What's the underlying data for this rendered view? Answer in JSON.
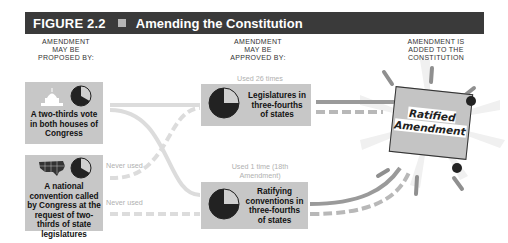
{
  "header": {
    "figure_number": "FIGURE 2.2",
    "title": "Amending the Constitution",
    "bar_color": "#3a3a3a"
  },
  "columns": {
    "proposed": "AMENDMENT MAY BE PROPOSED BY:",
    "approved": "AMENDMENT MAY BE APPROVED BY:",
    "added": "AMENDMENT IS ADDED TO THE CONSTITUTION"
  },
  "proposal_methods": [
    {
      "label": "A two-thirds vote in both houses of Congress",
      "icon": "capitol-icon",
      "fraction": "2/3"
    },
    {
      "label": "A national convention called by Congress at the request of two-thirds of state legislatures",
      "icon": "us-map-icon",
      "fraction": "2/3"
    }
  ],
  "ratification_methods": [
    {
      "label": "Legislatures in three-fourths of states",
      "usage": "Used 26 times",
      "fraction": "3/4"
    },
    {
      "label": "Ratifying conventions in three-fourths of states",
      "usage": "Used 1 time (18th Amendment)",
      "fraction": "3/4"
    }
  ],
  "path_notes": {
    "convention_to_legislatures": "Never used",
    "convention_to_conventions": "Never used"
  },
  "result": {
    "label": "Ratified Amendment"
  }
}
